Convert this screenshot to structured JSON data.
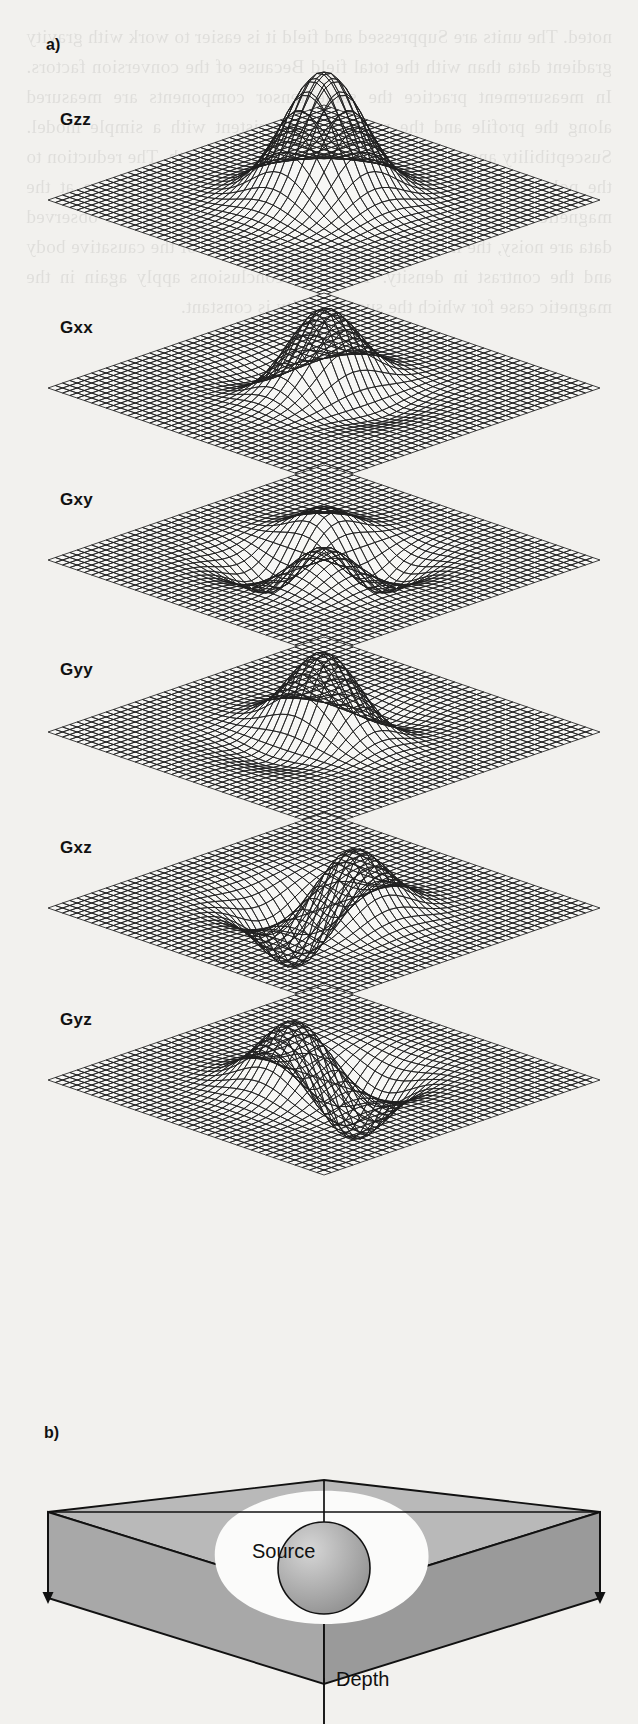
{
  "figure": {
    "parts": [
      {
        "id": "a",
        "label": "a)",
        "x": 46,
        "y": 36
      },
      {
        "id": "b",
        "label": "b)",
        "x": 44,
        "y": 1424
      }
    ],
    "panel_a": {
      "description": "Six gravity gradient tensor component surfaces rendered as stacked 3-D wire-mesh sheets",
      "components": [
        {
          "label": "Gzz",
          "label_x": 60,
          "label_y": 110,
          "top": 48,
          "kind": "central-peak"
        },
        {
          "label": "Gxx",
          "label_x": 60,
          "label_y": 318,
          "top": 236,
          "kind": "ridge-ne"
        },
        {
          "label": "Gxy",
          "label_x": 60,
          "label_y": 490,
          "top": 408,
          "kind": "quadrupole"
        },
        {
          "label": "Gyy",
          "label_x": 60,
          "label_y": 660,
          "top": 580,
          "kind": "ridge-nw"
        },
        {
          "label": "Gxz",
          "label_x": 60,
          "label_y": 838,
          "top": 756,
          "kind": "dipole-x"
        },
        {
          "label": "Gyz",
          "label_x": 60,
          "label_y": 1010,
          "top": 928,
          "kind": "dipole-y"
        }
      ]
    },
    "panel_b": {
      "description": "Isometric block of the subsurface containing a buried spherical source",
      "source_label": "Source",
      "depth_label": "Depth",
      "depth_arrow_count": 3,
      "block_top_color": "#b9b9b9",
      "block_front_color": "#9a9a9a",
      "block_side_color": "#a8a8a8",
      "halo_color": "#fbfbfa",
      "source_color": "#9d9d9d"
    },
    "colors": {
      "paper": "#f2f1ee",
      "ink": "#1a1a1a",
      "mesh": "#202020",
      "mesh_fill": "#f7f7f5"
    }
  },
  "chart_data": {
    "type": "surface",
    "subtitle": "",
    "xlabel": "x",
    "ylabel": "y",
    "zlabel": "gradient amplitude",
    "grid": true,
    "legend_position": "left",
    "panels": [
      {
        "name": "Gzz",
        "formula": "(2z^2 - x^2 - y^2) / r^5",
        "extrema": "single positive peak centred over the source",
        "peak_amplitude": 1.0,
        "min_amplitude": -0.08,
        "symmetry": "radial"
      },
      {
        "name": "Gxx",
        "formula": "(2x^2 - y^2 - z^2) / r^5",
        "extrema": "central positive high flanked by two negative lows along x",
        "peak_amplitude": 0.45,
        "min_amplitude": -0.3,
        "symmetry": "elongated along x"
      },
      {
        "name": "Gxy",
        "formula": "3xy / r^5",
        "extrema": "four-lobed quadrupole, two positive and two negative",
        "peak_amplitude": 0.38,
        "min_amplitude": -0.38,
        "symmetry": "diagonal quadrupole"
      },
      {
        "name": "Gyy",
        "formula": "(2y^2 - x^2 - z^2) / r^5",
        "extrema": "central positive high flanked by two negative lows along y",
        "peak_amplitude": 0.45,
        "min_amplitude": -0.3,
        "symmetry": "elongated along y"
      },
      {
        "name": "Gxz",
        "formula": "3xz / r^5",
        "extrema": "antisymmetric dipole: positive lobe and negative lobe along x",
        "peak_amplitude": 0.5,
        "min_amplitude": -0.5,
        "symmetry": "antisymmetric about x"
      },
      {
        "name": "Gyz",
        "formula": "3yz / r^5",
        "extrema": "antisymmetric dipole: positive lobe and negative lobe along y",
        "peak_amplitude": 0.5,
        "min_amplitude": -0.5,
        "symmetry": "antisymmetric about y"
      }
    ],
    "grid_resolution": "41 x 41 mesh",
    "view": {
      "azimuth": 45,
      "elevation": 30,
      "projection": "isometric"
    }
  },
  "bleed_text": "noted. The units are Suppressed and field it is easier to work with gravity gradient data than with the total field Because of the conversion factors. In measurement practice the same tensor components are measured along the profile and the results are consistent with a simple model. Susceptibility anomalies over the mid field of the Earth. The reduction to the pole operator in the frequency domain for a dipole source at the magnetic latitude gives the vertical component. Although the observed data are noisy, the inversion still resolves the depth of the causative body and the contrast in density. The same conclusions apply again in the magnetic case for which the susceptibility is constant."
}
